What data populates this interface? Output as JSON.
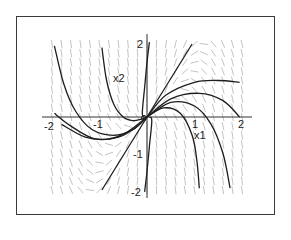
{
  "chart_data": {
    "type": "line",
    "subtype": "phase-portrait-direction-field",
    "title": "",
    "xlabel": "x1",
    "ylabel": "x2",
    "xlim": [
      -2.2,
      2.2
    ],
    "ylim": [
      -2.2,
      2.2
    ],
    "x_ticks": [
      -2,
      -1,
      1,
      2
    ],
    "y_ticks": [
      -2,
      -1,
      2
    ],
    "x_tick_labels": [
      "-2",
      "-1",
      "1",
      "2"
    ],
    "y_tick_labels": [
      "-2",
      "-1",
      "2"
    ],
    "grid": false,
    "legend": null,
    "direction_field": {
      "x_range": [
        -2,
        2
      ],
      "y_range": [
        -2,
        2
      ],
      "color": "#9a9a9a"
    },
    "series": [
      {
        "name": "eigen-line",
        "points": [
          [
            -0.95,
            -2.0
          ],
          [
            0.95,
            2.0
          ]
        ]
      },
      {
        "name": "traj-upper-left-outer",
        "points": [
          [
            -1.95,
            1.95
          ],
          [
            -1.75,
            0.9
          ],
          [
            -1.5,
            0.15
          ],
          [
            -1.15,
            -0.35
          ],
          [
            -0.7,
            -0.5
          ],
          [
            -0.3,
            -0.35
          ],
          [
            0,
            0
          ]
        ]
      },
      {
        "name": "traj-upper-left-inner",
        "points": [
          [
            -0.95,
            1.9
          ],
          [
            -0.85,
            1.0
          ],
          [
            -0.7,
            0.35
          ],
          [
            -0.5,
            0.0
          ],
          [
            -0.3,
            -0.1
          ],
          [
            -0.1,
            -0.05
          ],
          [
            0,
            0
          ]
        ]
      },
      {
        "name": "traj-left-lower",
        "points": [
          [
            -1.95,
            0.1
          ],
          [
            -1.6,
            -0.25
          ],
          [
            -1.1,
            -0.6
          ],
          [
            -0.6,
            -0.55
          ],
          [
            -0.25,
            -0.3
          ],
          [
            0,
            0
          ]
        ]
      },
      {
        "name": "traj-left-lowest",
        "points": [
          [
            -1.8,
            -0.2
          ],
          [
            -1.3,
            -0.55
          ],
          [
            -0.8,
            -0.6
          ],
          [
            -0.4,
            -0.4
          ],
          [
            0,
            0
          ]
        ]
      },
      {
        "name": "traj-near-axis-up",
        "points": [
          [
            -0.05,
            0.0
          ],
          [
            -0.1,
            0.1
          ],
          [
            -0.05,
            0.8
          ],
          [
            0.0,
            1.5
          ],
          [
            0.05,
            2.05
          ]
        ]
      },
      {
        "name": "traj-near-axis-down",
        "points": [
          [
            0.05,
            0.0
          ],
          [
            0.1,
            -0.1
          ],
          [
            0.05,
            -0.8
          ],
          [
            0.0,
            -1.5
          ],
          [
            -0.05,
            -2.05
          ]
        ]
      },
      {
        "name": "traj-right-upper",
        "points": [
          [
            0,
            0
          ],
          [
            0.4,
            0.6
          ],
          [
            1.0,
            0.95
          ],
          [
            1.5,
            1.0
          ],
          [
            1.95,
            0.95
          ]
        ]
      },
      {
        "name": "traj-right-mid",
        "points": [
          [
            0,
            0
          ],
          [
            0.5,
            0.5
          ],
          [
            1.1,
            0.65
          ],
          [
            1.6,
            0.45
          ],
          [
            1.95,
            0.0
          ]
        ]
      },
      {
        "name": "traj-right-lower",
        "points": [
          [
            0,
            0
          ],
          [
            0.5,
            0.4
          ],
          [
            1.0,
            0.3
          ],
          [
            1.35,
            -0.2
          ],
          [
            1.6,
            -1.0
          ],
          [
            1.75,
            -1.95
          ]
        ]
      },
      {
        "name": "traj-right-lowest",
        "points": [
          [
            0,
            0
          ],
          [
            0.35,
            0.25
          ],
          [
            0.7,
            0.1
          ],
          [
            0.95,
            -0.5
          ],
          [
            1.05,
            -1.2
          ],
          [
            1.1,
            -1.95
          ]
        ]
      }
    ]
  },
  "labels": {
    "x_axis_name": "x1",
    "y_axis_name": "x2",
    "x_neg2": "-2",
    "x_neg1": "-1",
    "x_pos1": "1",
    "x_pos2": "2",
    "y_pos2": "2",
    "y_neg1": "-1",
    "y_neg2": "-2"
  },
  "colors": {
    "frame": "#3a3a3a",
    "axis": "#333333",
    "trajectory": "#1e1e1e",
    "field": "#9a9a9a"
  }
}
